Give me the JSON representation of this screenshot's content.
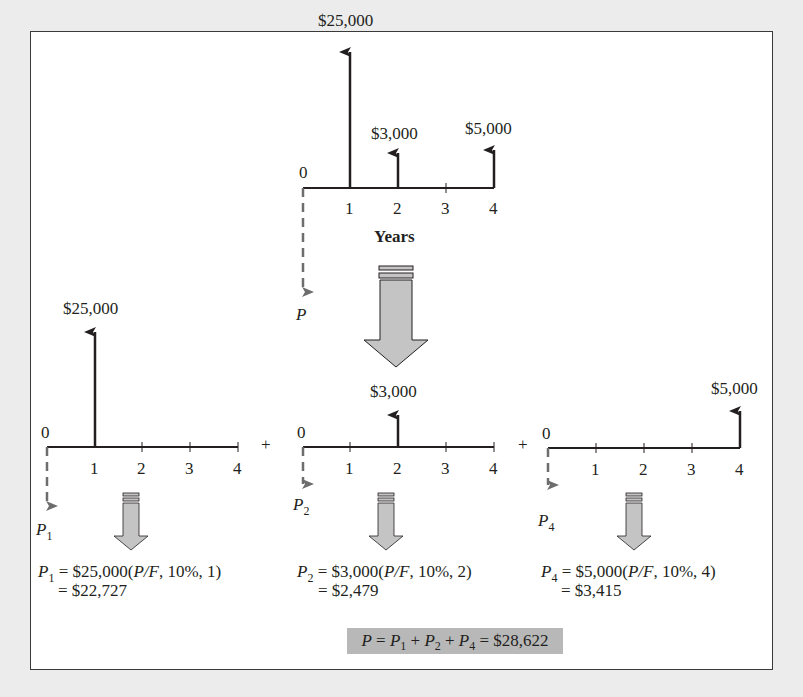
{
  "colors": {
    "background": "#ececec",
    "panel": "#ffffff",
    "ink": "#231f20",
    "dashed_arrow": "#6d6d6d",
    "block_arrow_fill": "#c4c4c4",
    "result_box": "#b8b8b8"
  },
  "top_diagram": {
    "zero_label": "0",
    "ticks": [
      "1",
      "2",
      "3",
      "4"
    ],
    "axis_label": "Years",
    "present_value_label": "P",
    "cash_flows": [
      {
        "period": 1,
        "amount": "$25,000"
      },
      {
        "period": 2,
        "amount": "$3,000"
      },
      {
        "period": 4,
        "amount": "$5,000"
      }
    ]
  },
  "sub_diagrams": [
    {
      "zero_label": "0",
      "ticks": [
        "1",
        "2",
        "3",
        "4"
      ],
      "cash_flow": {
        "period": 1,
        "amount": "$25,000"
      },
      "pv_label": "P",
      "pv_sub": "1",
      "equation": {
        "lhs": "P",
        "sub": "1",
        "amount": " = $25,000(",
        "factor": "P/F",
        "args": ", 10%, 1)",
        "result": "= $22,727"
      }
    },
    {
      "zero_label": "0",
      "ticks": [
        "1",
        "2",
        "3",
        "4"
      ],
      "cash_flow": {
        "period": 2,
        "amount": "$3,000"
      },
      "pv_label": "P",
      "pv_sub": "2",
      "equation": {
        "lhs": "P",
        "sub": "2",
        "amount": " = $3,000(",
        "factor": "P/F",
        "args": ", 10%, 2)",
        "result": "= $2,479"
      }
    },
    {
      "zero_label": "0",
      "ticks": [
        "1",
        "2",
        "3",
        "4"
      ],
      "cash_flow": {
        "period": 4,
        "amount": "$5,000"
      },
      "pv_label": "P",
      "pv_sub": "4",
      "equation": {
        "lhs": "P",
        "sub": "4",
        "amount": " = $5,000(",
        "factor": "P/F",
        "args": ", 10%, 4)",
        "result": "= $3,415"
      }
    }
  ],
  "plus_signs": [
    "+",
    "+"
  ],
  "total": {
    "p": "P",
    "eq": " = ",
    "p1": "P",
    "s1": "1",
    "plus": " + ",
    "p2": "P",
    "s2": "2",
    "p4": "P",
    "s4": "4",
    "result": " = $28,622"
  }
}
